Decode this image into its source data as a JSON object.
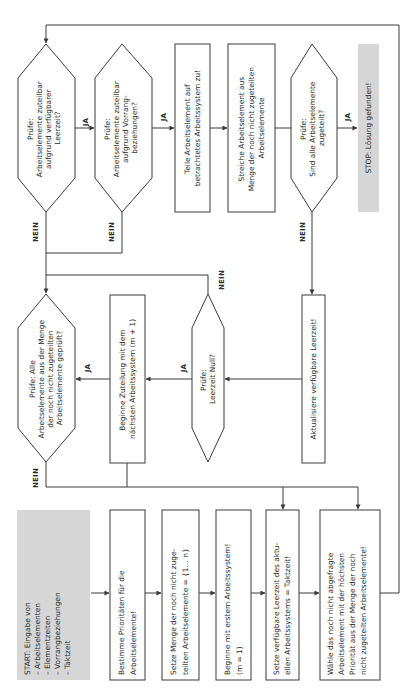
{
  "diagram": {
    "title": "",
    "orientation": "rotated-90-ccw",
    "colors": {
      "line": "#3a3a3a",
      "terminal_fill": "#d6d6d6",
      "box_fill": "#ffffff",
      "text": "#2a2a2a"
    },
    "nodes": {
      "start": {
        "type": "terminal",
        "lines": [
          "START: Eingabe von",
          "– Arbeitselementen",
          "– Elementzeiten",
          "– Vorrangbeziehungen",
          "– Taktzeit"
        ]
      },
      "priorities": {
        "type": "process",
        "lines": [
          "Bestimme Prioritäten für die",
          "Arbeitselemente!"
        ]
      },
      "set_elements": {
        "type": "process",
        "lines": [
          "Setze Menge der noch nicht  zuge-",
          "teilten Arbeitselemente = {1… n}"
        ]
      },
      "first_system": {
        "type": "process",
        "lines": [
          "Beginne mit erstem Arbeitssystem!",
          "(m = 1)"
        ]
      },
      "set_idle": {
        "type": "process",
        "lines": [
          "Setze verfügbare Leerzeit des aktu-",
          "ellen Arbeitssystems = Taktzeit!"
        ]
      },
      "choose": {
        "type": "process",
        "lines": [
          "Wähle das noch nicht abgefragte",
          "Arbeitselement mit der höchsten",
          "Priorität aus der Menge der noch",
          "nicht zugeteilten Arbeitselemente!"
        ]
      },
      "check_all_checked": {
        "type": "decision",
        "lines": [
          "Prüfe: Alle",
          "Arbeitselemente aus der Menge",
          "der noch nicht zugeteilten",
          "Arbeitselemente geprüft?"
        ]
      },
      "next_system": {
        "type": "process",
        "lines": [
          "Beginne Zuteilung mit dem",
          "nächsten Arbeitssystem (m + 1)"
        ]
      },
      "check_idle_zero": {
        "type": "decision",
        "lines": [
          "Prüfe:",
          "Leerzeit Null?"
        ]
      },
      "update_idle": {
        "type": "process",
        "lines": [
          "Aktualisiere verfügbare Leerzeit!"
        ]
      },
      "check_time": {
        "type": "decision",
        "lines": [
          "Prüfe:",
          "Arbeitselemente zuteilbar",
          "aufgrund verfügbarer",
          "Leerzeit?"
        ]
      },
      "check_precedence": {
        "type": "decision",
        "lines": [
          "Prüfe:",
          "Arbeitselemente zuteilbar",
          "aufgrund Vorrang-",
          "beziehungen?"
        ]
      },
      "assign": {
        "type": "process",
        "lines": [
          "Teile Arbeitselement auf",
          "betrachtetes Arbeitssystem zu!"
        ]
      },
      "remove": {
        "type": "process",
        "lines": [
          "Streiche Arbeitselement aus",
          "Menge der noch nicht zugeteilten",
          "Arbeitselemente"
        ]
      },
      "check_all_assigned": {
        "type": "decision",
        "lines": [
          "Prüfe:",
          "Sind alle Arbeitselemente",
          "zugeteilt?"
        ]
      },
      "stop": {
        "type": "terminal",
        "lines": [
          "STOP: Lösung gefunden!"
        ]
      }
    },
    "edge_labels": {
      "yes": "JA",
      "no": "NEIN"
    },
    "edges": [
      {
        "from": "start",
        "to": "priorities",
        "label": ""
      },
      {
        "from": "priorities",
        "to": "set_elements",
        "label": ""
      },
      {
        "from": "set_elements",
        "to": "first_system",
        "label": ""
      },
      {
        "from": "first_system",
        "to": "set_idle",
        "label": ""
      },
      {
        "from": "set_idle",
        "to": "choose",
        "label": ""
      },
      {
        "from": "choose",
        "to": "check_time",
        "label": ""
      },
      {
        "from": "check_time",
        "to": "check_precedence",
        "label": "JA"
      },
      {
        "from": "check_time",
        "to": "check_all_checked",
        "label": "NEIN"
      },
      {
        "from": "check_precedence",
        "to": "assign",
        "label": "JA"
      },
      {
        "from": "check_precedence",
        "to": "check_all_checked",
        "label": "NEIN"
      },
      {
        "from": "assign",
        "to": "remove",
        "label": ""
      },
      {
        "from": "remove",
        "to": "check_all_assigned",
        "label": ""
      },
      {
        "from": "check_all_assigned",
        "to": "stop",
        "label": "JA"
      },
      {
        "from": "check_all_assigned",
        "to": "update_idle",
        "label": "NEIN"
      },
      {
        "from": "update_idle",
        "to": "check_idle_zero",
        "label": ""
      },
      {
        "from": "check_idle_zero",
        "to": "next_system",
        "label": "JA"
      },
      {
        "from": "check_idle_zero",
        "to": "check_all_checked",
        "label": "NEIN"
      },
      {
        "from": "next_system",
        "to": "check_all_checked",
        "label": "JA"
      },
      {
        "from": "next_system",
        "to": "set_idle",
        "label": ""
      },
      {
        "from": "check_all_checked",
        "to": "set_idle",
        "label": "NEIN"
      },
      {
        "from": "check_all_checked",
        "to": "choose",
        "label": "NEIN"
      }
    ]
  }
}
